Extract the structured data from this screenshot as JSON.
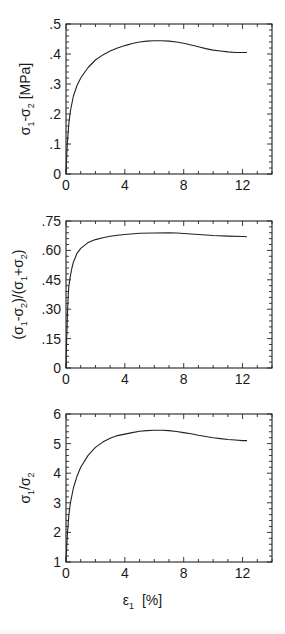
{
  "figure": {
    "shared_xlabel": "ε₁ [%]"
  },
  "chart_data": [
    {
      "type": "line",
      "title": "",
      "xlabel": "ε₁ [%]",
      "ylabel": "σ₁-σ₂ [MPa]",
      "ylabel_parts": {
        "base1": "σ",
        "sub1": "1",
        "mid": "-σ",
        "sub2": "2",
        "tail": " [MPa]"
      },
      "xlim": [
        0,
        14
      ],
      "ylim": [
        0,
        0.5
      ],
      "xticks": [
        0,
        4,
        8,
        12
      ],
      "xtick_labels": [
        "0",
        "4",
        "8",
        "12"
      ],
      "yticks": [
        0,
        0.1,
        0.2,
        0.3,
        0.4,
        0.5
      ],
      "ytick_labels": [
        "0",
        ".1",
        ".2",
        ".3",
        ".4",
        ".5"
      ],
      "grid": false,
      "legend": null,
      "series": [
        {
          "name": "σ1-σ2",
          "x": [
            0,
            0.05,
            0.1,
            0.2,
            0.3,
            0.5,
            0.75,
            1.0,
            1.5,
            2.0,
            2.5,
            3.0,
            3.5,
            4.0,
            4.5,
            5.0,
            5.5,
            6.0,
            6.5,
            7.0,
            7.5,
            8.0,
            8.5,
            9.0,
            9.5,
            10.0,
            10.5,
            11.0,
            11.5,
            12.0,
            12.3
          ],
          "y": [
            0,
            0.06,
            0.11,
            0.17,
            0.21,
            0.26,
            0.295,
            0.32,
            0.355,
            0.38,
            0.397,
            0.41,
            0.42,
            0.428,
            0.435,
            0.44,
            0.443,
            0.444,
            0.444,
            0.443,
            0.44,
            0.436,
            0.43,
            0.424,
            0.418,
            0.413,
            0.41,
            0.407,
            0.405,
            0.405,
            0.405
          ]
        }
      ]
    },
    {
      "type": "line",
      "title": "",
      "xlabel": "ε₁ [%]",
      "ylabel": "(σ₁-σ₂)/(σ₁+σ₂)",
      "ylabel_parts": {
        "open": "(σ",
        "sub1": "1",
        "mid1": "-σ",
        "sub2": "2",
        "mid2": ")/(σ",
        "sub3": "1",
        "mid3": "+σ",
        "sub4": "2",
        "close": ")"
      },
      "xlim": [
        0,
        14
      ],
      "ylim": [
        0,
        0.75
      ],
      "xticks": [
        0,
        4,
        8,
        12
      ],
      "xtick_labels": [
        "0",
        "4",
        "8",
        "12"
      ],
      "yticks": [
        0,
        0.15,
        0.3,
        0.45,
        0.6,
        0.75
      ],
      "ytick_labels": [
        "0",
        ".15",
        ".30",
        ".45",
        ".60",
        ".75"
      ],
      "grid": false,
      "legend": null,
      "series": [
        {
          "name": "(σ1-σ2)/(σ1+σ2)",
          "x": [
            0,
            0.05,
            0.1,
            0.15,
            0.2,
            0.3,
            0.4,
            0.5,
            0.75,
            1.0,
            1.5,
            2.0,
            2.5,
            3.0,
            3.5,
            4.0,
            5.0,
            6.0,
            7.0,
            7.5,
            8.0,
            9.0,
            10.0,
            11.0,
            12.0,
            12.3
          ],
          "y": [
            0,
            0.15,
            0.28,
            0.37,
            0.42,
            0.47,
            0.51,
            0.54,
            0.585,
            0.61,
            0.64,
            0.655,
            0.665,
            0.672,
            0.677,
            0.681,
            0.687,
            0.689,
            0.69,
            0.689,
            0.686,
            0.681,
            0.676,
            0.673,
            0.671,
            0.67
          ]
        }
      ]
    },
    {
      "type": "line",
      "title": "",
      "xlabel": "ε₁ [%]",
      "ylabel": "σ₁/σ₂",
      "ylabel_parts": {
        "base1": "σ",
        "sub1": "1",
        "mid": "/σ",
        "sub2": "2"
      },
      "xlim": [
        0,
        14
      ],
      "ylim": [
        1,
        6
      ],
      "xticks": [
        0,
        4,
        8,
        12
      ],
      "xtick_labels": [
        "0",
        "4",
        "8",
        "12"
      ],
      "yticks": [
        1,
        2,
        3,
        4,
        5,
        6
      ],
      "ytick_labels": [
        "1",
        "2",
        "3",
        "4",
        "5",
        "6"
      ],
      "grid": false,
      "legend": null,
      "series": [
        {
          "name": "σ1/σ2",
          "x": [
            0,
            0.05,
            0.1,
            0.2,
            0.3,
            0.5,
            0.75,
            1.0,
            1.5,
            2.0,
            2.5,
            3.0,
            3.5,
            4.0,
            4.5,
            5.0,
            5.5,
            6.0,
            6.5,
            7.0,
            7.5,
            8.0,
            8.5,
            9.0,
            9.5,
            10.0,
            10.5,
            11.0,
            11.5,
            12.0,
            12.3
          ],
          "y": [
            1.0,
            1.5,
            2.0,
            2.6,
            3.0,
            3.5,
            3.9,
            4.2,
            4.6,
            4.87,
            5.05,
            5.18,
            5.27,
            5.32,
            5.37,
            5.42,
            5.44,
            5.45,
            5.45,
            5.44,
            5.41,
            5.37,
            5.33,
            5.28,
            5.24,
            5.2,
            5.17,
            5.14,
            5.12,
            5.1,
            5.1
          ]
        }
      ]
    }
  ]
}
